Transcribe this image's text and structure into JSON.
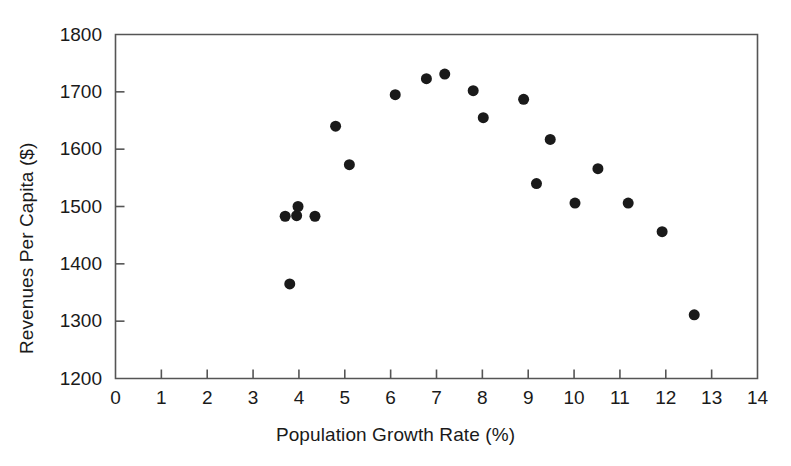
{
  "chart_data": {
    "type": "scatter",
    "title": "",
    "xlabel": "Population Growth Rate (%)",
    "ylabel": "Revenues Per Capita ($)",
    "xlim": [
      0,
      14
    ],
    "ylim": [
      1200,
      1800
    ],
    "xticks": [
      0,
      1,
      2,
      3,
      4,
      5,
      6,
      7,
      8,
      9,
      10,
      11,
      12,
      13,
      14
    ],
    "yticks": [
      1200,
      1300,
      1400,
      1500,
      1600,
      1700,
      1800
    ],
    "xtick_labels": [
      "0",
      "1",
      "2",
      "3",
      "4",
      "5",
      "6",
      "7",
      "8",
      "9",
      "10",
      "11",
      "12",
      "13",
      "14"
    ],
    "ytick_labels": [
      "1200",
      "1300",
      "1400",
      "1500",
      "1600",
      "1700",
      "1800"
    ],
    "grid": false,
    "legend": null,
    "marker": {
      "shape": "circle",
      "color": "#1a1a1a",
      "size": 11
    },
    "frame_color": "#555555",
    "points": [
      {
        "x": 3.7,
        "y": 1483
      },
      {
        "x": 3.8,
        "y": 1365
      },
      {
        "x": 3.95,
        "y": 1484
      },
      {
        "x": 3.98,
        "y": 1500
      },
      {
        "x": 4.35,
        "y": 1483
      },
      {
        "x": 4.8,
        "y": 1640
      },
      {
        "x": 5.1,
        "y": 1573
      },
      {
        "x": 6.1,
        "y": 1695
      },
      {
        "x": 6.78,
        "y": 1723
      },
      {
        "x": 7.18,
        "y": 1731
      },
      {
        "x": 7.8,
        "y": 1702
      },
      {
        "x": 8.02,
        "y": 1655
      },
      {
        "x": 8.9,
        "y": 1687
      },
      {
        "x": 9.18,
        "y": 1540
      },
      {
        "x": 9.48,
        "y": 1617
      },
      {
        "x": 10.02,
        "y": 1506
      },
      {
        "x": 10.52,
        "y": 1566
      },
      {
        "x": 11.18,
        "y": 1506
      },
      {
        "x": 11.92,
        "y": 1456
      },
      {
        "x": 12.62,
        "y": 1311
      }
    ]
  }
}
